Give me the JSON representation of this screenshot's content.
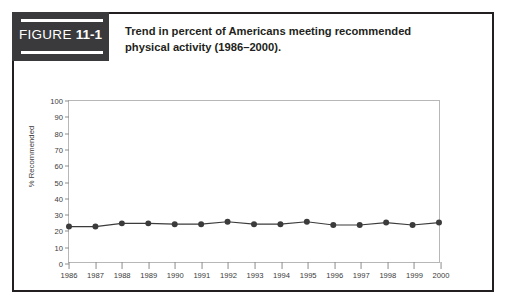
{
  "figure": {
    "label_word": "FIGURE",
    "label_number": "11-1",
    "caption_line1": "Trend in percent of Americans meeting recommended",
    "caption_line2": "physical activity (1986–2000)."
  },
  "colors": {
    "block_bg": "#3a3a3c",
    "frame": "#231f20",
    "plot_border": "#b7b7b7",
    "series": "#3b3b3b",
    "tick_text": "#3b3b3b"
  },
  "chart_data": {
    "type": "line",
    "title": "Trend in percent of Americans meeting recommended physical activity (1986–2000).",
    "xlabel": "",
    "ylabel": "% Recommended",
    "ylim": [
      0,
      100
    ],
    "ytick_labels": [
      "0",
      "10",
      "20",
      "30",
      "40",
      "50",
      "60",
      "70",
      "80",
      "90",
      "100"
    ],
    "ytick_values": [
      0,
      10,
      20,
      30,
      40,
      50,
      60,
      70,
      80,
      90,
      100
    ],
    "grid": false,
    "legend": false,
    "marker": "filled-circle",
    "categories": [
      "1986",
      "1987",
      "1988",
      "1989",
      "1990",
      "1991",
      "1992",
      "1993",
      "1994",
      "1995",
      "1996",
      "1997",
      "1998",
      "1999",
      "2000"
    ],
    "x": [
      1986,
      1987,
      1988,
      1989,
      1990,
      1991,
      1992,
      1993,
      1994,
      1995,
      1996,
      1997,
      1998,
      1999,
      2000
    ],
    "values": [
      22,
      22,
      24,
      24,
      23.5,
      23.5,
      25,
      23.5,
      23.5,
      25,
      23,
      23,
      24.5,
      23,
      24.5
    ],
    "series": [
      {
        "name": "% Recommended",
        "values": [
          22,
          22,
          24,
          24,
          23.5,
          23.5,
          25,
          23.5,
          23.5,
          25,
          23,
          23,
          24.5,
          23,
          24.5
        ]
      }
    ]
  }
}
